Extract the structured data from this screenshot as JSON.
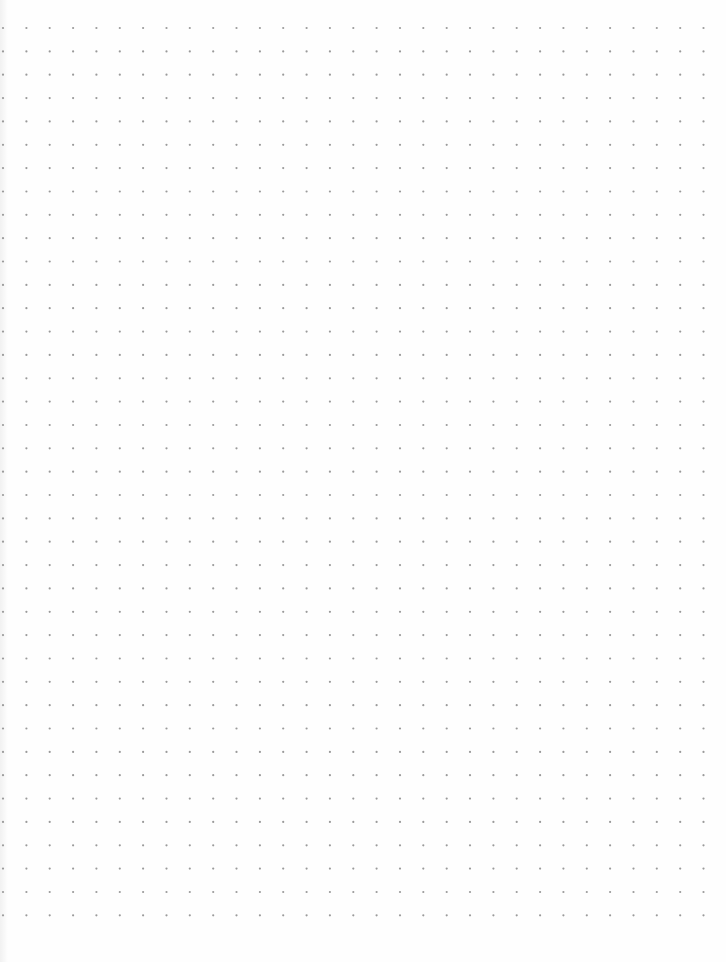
{
  "page": {
    "type": "dot-grid-paper",
    "background_color": "#fefefe",
    "dot_color": "#9a9a9a",
    "dot_radius": 1.1,
    "grid": {
      "origin_x": 3,
      "origin_y": 28,
      "spacing": 23.35,
      "columns": 31,
      "rows": 39
    }
  }
}
